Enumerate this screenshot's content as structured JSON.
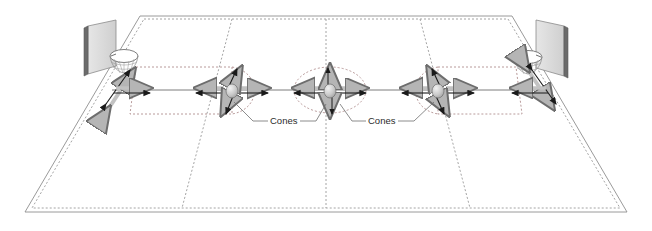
{
  "diagram": {
    "type": "perspective-court-diagram",
    "background_color": "#ffffff"
  },
  "colors": {
    "court_outline": "#8a8a8a",
    "court_dotted": "#9a9a9a",
    "midline": "#6e6e6e",
    "backboard_face": "#d9d9d9",
    "backboard_edge": "#6b6b6b",
    "rim": "#777777",
    "cone_fill": "#c9c9c9",
    "cone_stroke": "#555555",
    "arrow_dark": "#1a1a1a",
    "arrow_light": "#bdbdbd",
    "label": "#2b2b2b"
  },
  "court": {
    "name": "basketball-court",
    "outline_style": "solid",
    "inner_boundary_style": "dotted",
    "corners": {
      "top_left": [
        140,
        16
      ],
      "top_right": [
        512,
        16
      ],
      "bottom_right": [
        627,
        212
      ],
      "bottom_left": [
        25,
        212
      ]
    },
    "center_line_style": "dotted",
    "center_circle_style": "dotted"
  },
  "baskets": [
    {
      "id": "left-basket",
      "label": "Basket",
      "side": "left",
      "backboard": {
        "x": 82,
        "y": 22,
        "width": 40,
        "height": 52
      },
      "hoop": {
        "cx": 124,
        "cy": 60,
        "rx": 14,
        "ry": 8
      }
    },
    {
      "id": "right-basket",
      "label": "Basket",
      "side": "right",
      "backboard": {
        "x": 530,
        "y": 22,
        "width": 40,
        "height": 52
      },
      "hoop": {
        "cx": 528,
        "cy": 60,
        "rx": 14,
        "ry": 8
      }
    }
  ],
  "cones": [
    {
      "id": "cone-left",
      "x": 232,
      "y": 90,
      "arrows": [
        "left",
        "right",
        "up-right",
        "down-left"
      ]
    },
    {
      "id": "cone-center",
      "x": 330,
      "y": 90,
      "arrows": [
        "left",
        "right",
        "up",
        "down"
      ]
    },
    {
      "id": "cone-right",
      "x": 438,
      "y": 90,
      "arrows": [
        "left",
        "right",
        "up-left",
        "down-right"
      ]
    }
  ],
  "basket_arrows": [
    {
      "id": "left-basket-arrows",
      "x": 128,
      "y": 90,
      "arrows": [
        "right",
        "up-right",
        "down-left"
      ]
    },
    {
      "id": "right-basket-arrows",
      "x": 538,
      "y": 90,
      "arrows": [
        "left",
        "up-right",
        "down-left"
      ]
    }
  ],
  "labels": [
    {
      "id": "cones-label-left",
      "text": "Cones",
      "x": 270,
      "y": 124,
      "anchor": "start",
      "leader_to": [
        [
          254,
          121
        ],
        [
          232,
          121
        ]
      ],
      "pointers": [
        [
          232,
          100
        ],
        [
          316,
          104
        ]
      ]
    },
    {
      "id": "cones-label-right",
      "text": "Cones",
      "x": 368,
      "y": 124,
      "anchor": "start",
      "leader_to": [
        [
          352,
          121
        ],
        [
          404,
          121
        ]
      ],
      "pointers": [
        [
          346,
          104
        ],
        [
          428,
          100
        ]
      ]
    }
  ]
}
